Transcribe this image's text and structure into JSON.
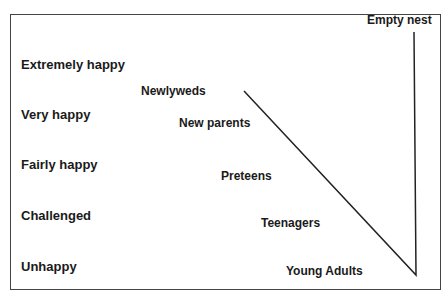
{
  "diagram": {
    "y_axis_levels": [
      "Extremely happy",
      "Very happy",
      "Fairly happy",
      "Challenged",
      "Unhappy"
    ],
    "stages": [
      "Newlyweds",
      "New parents",
      "Preteens",
      "Teenagers",
      "Young Adults",
      "Empty nest"
    ],
    "line_color": "#222222"
  }
}
